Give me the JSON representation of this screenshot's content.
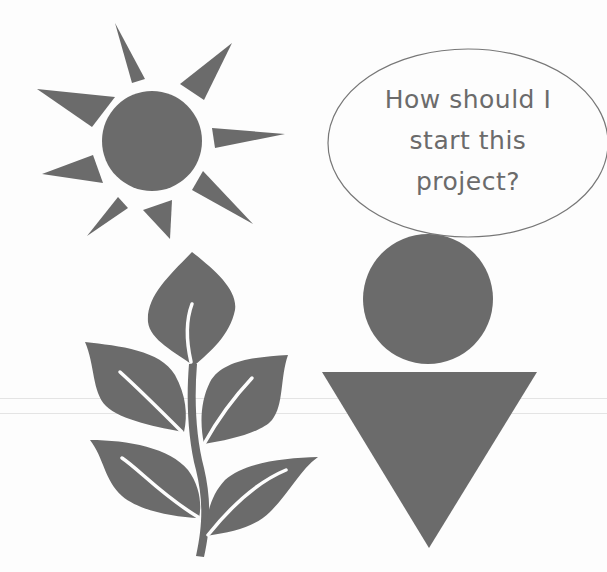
{
  "illustration": {
    "speech_bubble": {
      "lines": [
        "How should I",
        "start this",
        "project?"
      ]
    },
    "elements": [
      "sun",
      "plant",
      "person",
      "speech-bubble"
    ],
    "colors": {
      "fill": "#6b6b6b",
      "text": "#6b6b6b",
      "bubble_outline": "#777777",
      "background": "#fdfdfd"
    }
  }
}
